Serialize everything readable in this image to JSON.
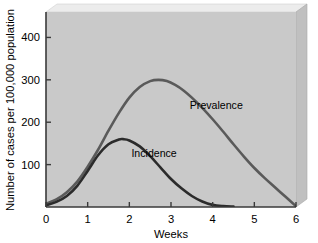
{
  "chart_data": {
    "type": "line",
    "title": "",
    "xlabel": "Weeks",
    "ylabel": "Number of cases per 100,000 population",
    "xlim": [
      0,
      6
    ],
    "ylim": [
      0,
      460
    ],
    "xticks": [
      "0",
      "1",
      "2",
      "3",
      "4",
      "5",
      "6"
    ],
    "xtick_values": [
      0,
      1,
      2,
      3,
      4,
      5,
      6
    ],
    "yticks": [
      "100",
      "200",
      "300",
      "400"
    ],
    "ytick_values": [
      100,
      200,
      300,
      400
    ],
    "grid": false,
    "legend_position": "inline-annotations",
    "background_color": "#c9c9c9",
    "axis_color": "#3a3a3a",
    "series": [
      {
        "name": "Prevalence",
        "color": "#5a5a5a",
        "label_x": 3.45,
        "label_y": 232,
        "x": [
          0,
          0.25,
          0.5,
          0.75,
          1.0,
          1.25,
          1.5,
          1.75,
          2.0,
          2.25,
          2.5,
          2.7,
          2.9,
          3.1,
          3.3,
          3.5,
          3.75,
          4.0,
          4.25,
          4.5,
          4.75,
          5.0,
          5.25,
          5.5,
          5.75,
          6.0
        ],
        "y": [
          8,
          18,
          35,
          60,
          95,
          135,
          180,
          222,
          258,
          283,
          297,
          300,
          297,
          288,
          275,
          258,
          234,
          207,
          178,
          148,
          119,
          92,
          68,
          46,
          24,
          2
        ]
      },
      {
        "name": "Incidence",
        "color": "#2b2b2b",
        "label_x": 2.05,
        "label_y": 118,
        "x": [
          0,
          0.25,
          0.5,
          0.75,
          1.0,
          1.25,
          1.5,
          1.75,
          1.85,
          2.0,
          2.25,
          2.5,
          2.75,
          3.0,
          3.25,
          3.5,
          3.75,
          4.0,
          4.25,
          4.5
        ],
        "y": [
          4,
          12,
          26,
          50,
          85,
          122,
          148,
          159,
          160,
          157,
          143,
          120,
          93,
          66,
          44,
          26,
          13,
          5,
          2,
          1
        ]
      }
    ]
  },
  "axes": {
    "ylabel": "Number of cases per 100,000 population",
    "xlabel": "Weeks"
  },
  "annotations": {
    "prevalence": "Prevalence",
    "incidence": "Incidence"
  }
}
